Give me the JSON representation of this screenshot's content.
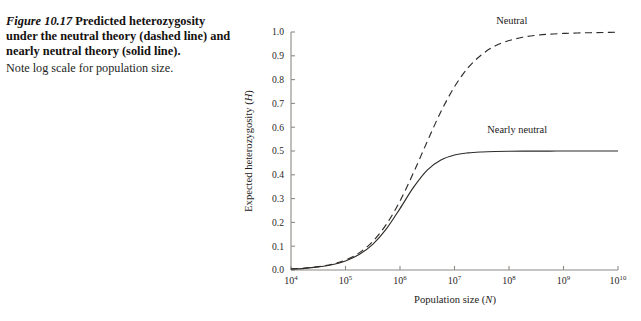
{
  "caption": {
    "figure_number": "Figure 10.17",
    "headline": "Predicted heterozygosity under the neutral theory (dashed line) and nearly neutral theory (solid line).",
    "note": "Note log scale for population size."
  },
  "chart_data": {
    "type": "line",
    "title": "",
    "xlabel": "Population size (N)",
    "ylabel": "Expected heterozygosity (H)",
    "xlabel_italic": "N",
    "ylabel_italic": "H",
    "x_scale": "log10",
    "xlim": [
      4,
      10
    ],
    "ylim": [
      0.0,
      1.0
    ],
    "grid": false,
    "legend_position": "inline-annotations",
    "x_tick_labels": [
      "10⁴",
      "10⁵",
      "10⁶",
      "10⁷",
      "10⁸",
      "10⁹",
      "10¹⁰"
    ],
    "x_tick_bases": [
      "10",
      "10",
      "10",
      "10",
      "10",
      "10",
      "10"
    ],
    "x_tick_exponents": [
      "4",
      "5",
      "6",
      "7",
      "8",
      "9",
      "10"
    ],
    "x_tick_values": [
      4,
      5,
      6,
      7,
      8,
      9,
      10
    ],
    "y_tick_labels": [
      "0.0",
      "0.1",
      "0.2",
      "0.3",
      "0.4",
      "0.5",
      "0.6",
      "0.7",
      "0.8",
      "0.9",
      "1.0"
    ],
    "y_tick_values": [
      0.0,
      0.1,
      0.2,
      0.3,
      0.4,
      0.5,
      0.6,
      0.7,
      0.8,
      0.9,
      1.0
    ],
    "series": [
      {
        "name": "Neutral",
        "style": "dashed",
        "color": "#2e2b28",
        "annotation": "Neutral",
        "annotation_x": 8.05,
        "annotation_y": 1.0,
        "asymptote": 1.0,
        "x": [
          4.0,
          4.25,
          4.5,
          4.75,
          5.0,
          5.25,
          5.5,
          5.75,
          6.0,
          6.25,
          6.5,
          6.75,
          7.0,
          7.25,
          7.5,
          7.75,
          8.0,
          8.25,
          8.5,
          8.75,
          9.0,
          9.25,
          9.5,
          9.75,
          10.0
        ],
        "values": [
          0.005,
          0.008,
          0.014,
          0.024,
          0.042,
          0.072,
          0.12,
          0.192,
          0.29,
          0.41,
          0.54,
          0.665,
          0.77,
          0.85,
          0.905,
          0.942,
          0.964,
          0.978,
          0.986,
          0.991,
          0.994,
          0.996,
          0.997,
          0.998,
          0.999
        ]
      },
      {
        "name": "Nearly neutral",
        "style": "solid",
        "color": "#2e2b28",
        "annotation": "Nearly neutral",
        "annotation_x": 8.15,
        "annotation_y": 0.56,
        "asymptote": 0.5,
        "x": [
          4.0,
          4.25,
          4.5,
          4.75,
          5.0,
          5.25,
          5.5,
          5.75,
          6.0,
          6.25,
          6.5,
          6.75,
          7.0,
          7.25,
          7.5,
          7.75,
          8.0,
          8.25,
          8.5,
          8.75,
          9.0,
          9.25,
          9.5,
          9.75,
          10.0
        ],
        "values": [
          0.004,
          0.007,
          0.013,
          0.022,
          0.038,
          0.065,
          0.108,
          0.173,
          0.258,
          0.348,
          0.42,
          0.462,
          0.483,
          0.492,
          0.496,
          0.498,
          0.499,
          0.4995,
          0.4997,
          0.4998,
          0.4999,
          0.5,
          0.5,
          0.5,
          0.5
        ]
      }
    ]
  },
  "colors": {
    "curve": "#2e2b28",
    "axis": "#8d8a86",
    "text": "#1d1a18",
    "background": "#ffffff"
  }
}
